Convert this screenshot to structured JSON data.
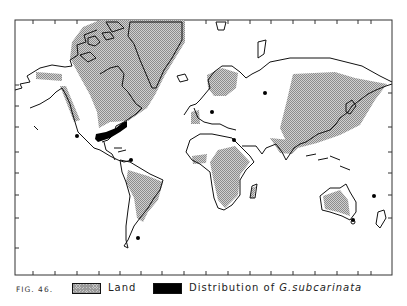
{
  "figure": {
    "label": "FIG. 46.",
    "type": "world distribution map (Mercator-like projection)"
  },
  "legend": {
    "items": [
      {
        "name": "land",
        "label": "Land",
        "swatch": "stippled gray",
        "color": "#c0c0c0"
      },
      {
        "name": "distribution",
        "label_prefix": "Distribution of ",
        "label_species": "G.subcarinata",
        "swatch": "solid black",
        "color": "#000000"
      }
    ]
  },
  "map": {
    "frame": {
      "left": 15,
      "top": 20,
      "right": 392,
      "bottom": 275
    },
    "left_ticks_y": [
      85,
      106,
      127,
      152,
      173,
      195,
      218,
      248
    ],
    "right_ticks_y": [
      93,
      127,
      152,
      173,
      195,
      218
    ],
    "top_ticks_x": [
      33,
      55,
      77,
      99,
      120,
      141,
      162,
      184,
      206,
      228,
      250,
      271,
      293,
      315,
      337,
      358,
      371
    ],
    "bottom_ticks_x": [
      33,
      55,
      77,
      99,
      120,
      141,
      162,
      184,
      206,
      228,
      250,
      271,
      293,
      315,
      337,
      358,
      371
    ],
    "distribution_band": {
      "region": "Southeastern United States",
      "from": [
        96,
        138
      ],
      "to": [
        126,
        124
      ]
    },
    "distribution_points": [
      {
        "region": "California",
        "x": 77,
        "y": 136
      },
      {
        "region": "Venezuela coast",
        "x": 131,
        "y": 160
      },
      {
        "region": "Falkland Islands",
        "x": 138,
        "y": 238
      },
      {
        "region": "Central Europe",
        "x": 212,
        "y": 112
      },
      {
        "region": "Russia (Urals)",
        "x": 265,
        "y": 93
      },
      {
        "region": "Egypt / Sinai",
        "x": 234,
        "y": 140
      },
      {
        "region": "Tasmania",
        "x": 353,
        "y": 220
      },
      {
        "region": "Pacific island",
        "x": 374,
        "y": 196
      }
    ]
  }
}
